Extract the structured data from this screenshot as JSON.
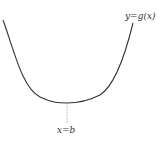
{
  "diagram": {
    "type": "function-graph",
    "curve_label": "y=g(x)",
    "min_label": "x=b",
    "colors": {
      "curve": "#333333",
      "dashed": "#999999",
      "text": "#333333",
      "background": "#ffffff"
    }
  }
}
